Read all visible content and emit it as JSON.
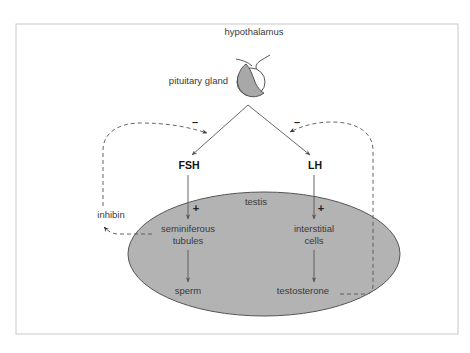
{
  "diagram": {
    "colors": {
      "frame": "#c8c8c8",
      "testis_fill": "#b3b3b3",
      "testis_stroke": "#555555",
      "gland_fill": "#a8a8a8",
      "line": "#555555",
      "text": "#3a3a3a"
    },
    "labels": {
      "hypothalamus": "hypothalamus",
      "pituitary": "pituitary gland",
      "fsh": "FSH",
      "lh": "LH",
      "testis": "testis",
      "inhibin": "inhibin",
      "seminiferous_1": "seminiferous",
      "seminiferous_2": "tubules",
      "interstitial_1": "interstitial",
      "interstitial_2": "cells",
      "sperm": "sperm",
      "testosterone": "testosterone"
    },
    "signs": {
      "fsh_inhibit": "–",
      "lh_inhibit": "–",
      "fsh_stimulate": "+",
      "lh_stimulate": "+"
    },
    "nodes": [
      {
        "id": "hypothalamus",
        "label": "hypothalamus"
      },
      {
        "id": "pituitary",
        "label": "pituitary gland"
      },
      {
        "id": "fsh",
        "label": "FSH"
      },
      {
        "id": "lh",
        "label": "LH"
      },
      {
        "id": "testis",
        "label": "testis"
      },
      {
        "id": "seminiferous",
        "label": "seminiferous tubules"
      },
      {
        "id": "interstitial",
        "label": "interstitial cells"
      },
      {
        "id": "sperm",
        "label": "sperm"
      },
      {
        "id": "testosterone",
        "label": "testosterone"
      },
      {
        "id": "inhibin",
        "label": "inhibin"
      }
    ],
    "edges": [
      {
        "from": "pituitary",
        "to": "fsh",
        "style": "solid"
      },
      {
        "from": "pituitary",
        "to": "lh",
        "style": "solid"
      },
      {
        "from": "fsh",
        "to": "seminiferous",
        "style": "solid",
        "sign": "+"
      },
      {
        "from": "lh",
        "to": "interstitial",
        "style": "solid",
        "sign": "+"
      },
      {
        "from": "seminiferous",
        "to": "sperm",
        "style": "solid"
      },
      {
        "from": "interstitial",
        "to": "testosterone",
        "style": "solid"
      },
      {
        "from": "seminiferous",
        "to": "inhibin",
        "style": "dashed"
      },
      {
        "from": "inhibin",
        "to": "pituitary",
        "style": "dashed",
        "sign": "–"
      },
      {
        "from": "testosterone",
        "to": "pituitary",
        "style": "dashed",
        "sign": "–"
      }
    ]
  }
}
